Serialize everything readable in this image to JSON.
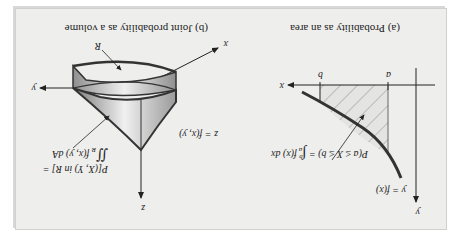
{
  "panel_a": {
    "title": "(a) Probability as an area",
    "axis_y": "y",
    "axis_x": "x",
    "tick_a": "a",
    "tick_b": "b",
    "curve_label": "y = f(x)",
    "formula_lhs": "P(a ≤ X ≤ b) = ",
    "formula_int_upper": "b",
    "formula_int_lower": "a",
    "formula_rhs": "f(x) dx"
  },
  "panel_b": {
    "title": "(b) Joint probability as a volume",
    "axis_z": "z",
    "axis_y": "y",
    "axis_x": "x",
    "region_label": "R",
    "surface_label": "z = f(x, y)",
    "formula_line1": "P[(X, Y) in R] =",
    "formula_int_sub": "R",
    "formula_rhs": "f(x, y) dA"
  },
  "orientation": "rotated 180°",
  "colors": {
    "panel_bg": "#eeeeed",
    "line": "#222222",
    "curve": "#333333",
    "solid_light": "#e6e6e6",
    "solid_dark": "#8a8a8a"
  }
}
